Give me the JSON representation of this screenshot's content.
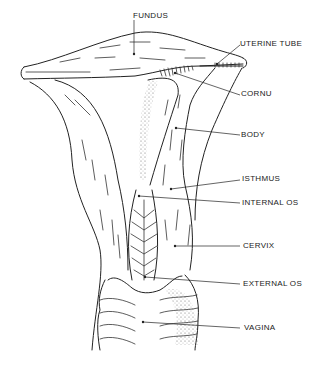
{
  "diagram": {
    "labels": [
      {
        "id": "fundus",
        "text": "FUNDUS"
      },
      {
        "id": "uterine-tube",
        "text": "UTERINE TUBE"
      },
      {
        "id": "cornu",
        "text": "CORNU"
      },
      {
        "id": "body",
        "text": "BODY"
      },
      {
        "id": "isthmus",
        "text": "ISTHMUS"
      },
      {
        "id": "internal-os",
        "text": "INTERNAL OS"
      },
      {
        "id": "cervix",
        "text": "CERVIX"
      },
      {
        "id": "external-os",
        "text": "EXTERNAL OS"
      },
      {
        "id": "vagina",
        "text": "VAGINA"
      }
    ],
    "colors": {
      "ink": "#222222",
      "background": "#ffffff"
    }
  }
}
